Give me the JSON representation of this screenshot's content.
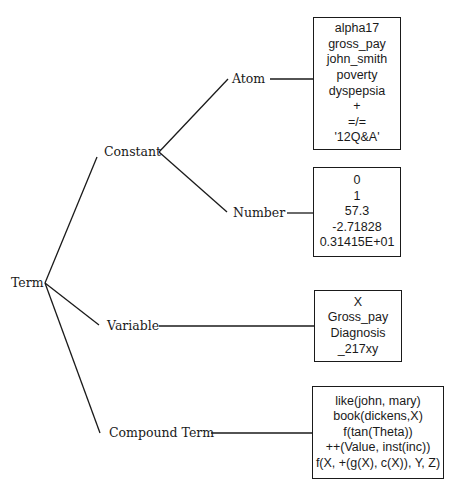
{
  "diagram": {
    "type": "tree",
    "root": {
      "label": "Term"
    },
    "branches": {
      "constant": {
        "label": "Constant",
        "children": {
          "atom": {
            "label": "Atom",
            "examples": [
              "alpha17",
              "gross_pay",
              "john_smith",
              "poverty",
              "dyspepsia",
              "+",
              "=/=",
              "'12Q&A'"
            ]
          },
          "number": {
            "label": "Number",
            "examples": [
              "0",
              "1",
              "57.3",
              "-2.71828",
              "0.31415E+01"
            ]
          }
        }
      },
      "variable": {
        "label": "Variable",
        "examples": [
          "X",
          "Gross_pay",
          "Diagnosis",
          "_217xy"
        ]
      },
      "compound": {
        "label": "Compound Term",
        "examples": [
          "like(john, mary)",
          "book(dickens,X)",
          "f(tan(Theta))",
          "++(Value, inst(inc))",
          "f(X, +(g(X), c(X)), Y, Z)"
        ]
      }
    }
  }
}
